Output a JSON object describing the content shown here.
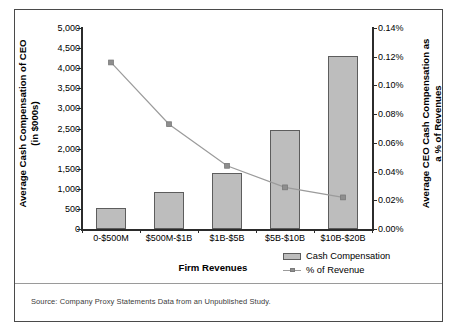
{
  "figure": {
    "source_note": "Source: Company Proxy Statements Data from an Unpublished Study.",
    "legend": [
      {
        "label": "Cash Compensation",
        "type": "bar",
        "color": "#bdbdbd"
      },
      {
        "label": "% of Revenue",
        "type": "line",
        "color": "#9b9b9b"
      }
    ]
  },
  "chart_data": {
    "type": "bar",
    "title": "",
    "xlabel": "Firm Revenues",
    "categories": [
      "0-$500M",
      "$500M-$1B",
      "$1B-$5B",
      "$5B-$10B",
      "$10B-$20B"
    ],
    "series": [
      {
        "name": "Cash Compensation",
        "type": "bar",
        "axis": "left",
        "values": [
          520,
          920,
          1390,
          2470,
          4300
        ],
        "color": "#bdbdbd"
      },
      {
        "name": "% of Revenue",
        "type": "line",
        "axis": "right",
        "values": [
          0.116,
          0.073,
          0.044,
          0.029,
          0.022
        ],
        "color": "#9b9b9b"
      }
    ],
    "left_axis": {
      "label": "Average Cash Compensation of CEO (in $000s)",
      "label_line1": "Average Cash Compensation of CEO",
      "label_line2": "(in $000s)",
      "ylim": [
        0,
        5000
      ],
      "ticks": [
        0,
        500,
        1000,
        1500,
        2000,
        2500,
        3000,
        3500,
        4000,
        4500,
        5000
      ],
      "tick_labels": [
        "0",
        "500",
        "1,000",
        "1,500",
        "2,000",
        "2,500",
        "3,000",
        "3,500",
        "4,000",
        "4,500",
        "5,000"
      ]
    },
    "right_axis": {
      "label": "Average CEO Cash Compensation as a % of Revenues",
      "label_line1": "Average CEO Cash Compensation as",
      "label_line2": "a % of Revenues",
      "ylim": [
        0,
        0.14
      ],
      "ticks": [
        0,
        0.02,
        0.04,
        0.06,
        0.08,
        0.1,
        0.12,
        0.14
      ],
      "tick_labels": [
        "0.00%",
        "0.02%",
        "0.04%",
        "0.06%",
        "0.08%",
        "0.10%",
        "0.12%",
        "0.14%"
      ]
    },
    "grid": false,
    "legend_position": "bottom-right"
  }
}
